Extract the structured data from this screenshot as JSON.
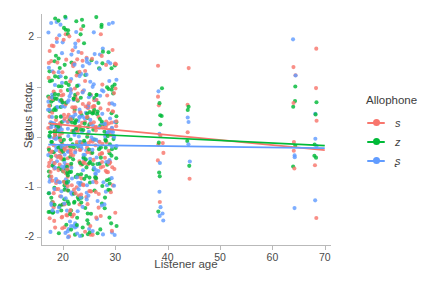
{
  "chart_data": {
    "type": "scatter",
    "title": "",
    "xlabel": "Listener age",
    "ylabel": "Status factor",
    "xlim": [
      16,
      71
    ],
    "ylim": [
      -2.15,
      2.45
    ],
    "xticks": [
      20,
      30,
      40,
      50,
      60,
      70
    ],
    "yticks": [
      -2,
      -1,
      0,
      1,
      2
    ],
    "grid": false,
    "legend_position": "right",
    "legend_title": "Allophone",
    "series": [
      {
        "name": "s",
        "color": "#F8766D",
        "trend_line": {
          "x0": 17.2,
          "y0": 0.27,
          "x1": 70.0,
          "y1": -0.26
        }
      },
      {
        "name": "z",
        "color": "#00BA38",
        "trend_line": {
          "x0": 17.2,
          "y0": 0.1,
          "x1": 70.0,
          "y1": -0.17
        }
      },
      {
        "name": "ʂ",
        "color": "#619CFF",
        "trend_line": {
          "x0": 17.2,
          "y0": -0.15,
          "x1": 70.0,
          "y1": -0.22
        }
      }
    ],
    "point_columns": [
      {
        "x": 17.4,
        "n": 40
      },
      {
        "x": 18.0,
        "n": 46
      },
      {
        "x": 18.6,
        "n": 44
      },
      {
        "x": 19.2,
        "n": 48
      },
      {
        "x": 19.8,
        "n": 46
      },
      {
        "x": 20.4,
        "n": 44
      },
      {
        "x": 21.0,
        "n": 42
      },
      {
        "x": 21.6,
        "n": 40
      },
      {
        "x": 22.2,
        "n": 42
      },
      {
        "x": 22.8,
        "n": 38
      },
      {
        "x": 23.4,
        "n": 40
      },
      {
        "x": 24.0,
        "n": 36
      },
      {
        "x": 24.6,
        "n": 34
      },
      {
        "x": 25.2,
        "n": 32
      },
      {
        "x": 25.8,
        "n": 30
      },
      {
        "x": 26.4,
        "n": 28
      },
      {
        "x": 27.0,
        "n": 26
      },
      {
        "x": 27.6,
        "n": 24
      },
      {
        "x": 28.2,
        "n": 26
      },
      {
        "x": 28.8,
        "n": 30
      },
      {
        "x": 29.4,
        "n": 28
      },
      {
        "x": 30.0,
        "n": 22
      },
      {
        "x": 38.4,
        "n": 20
      },
      {
        "x": 39.0,
        "n": 6
      },
      {
        "x": 44.0,
        "n": 12
      },
      {
        "x": 64.2,
        "n": 16
      },
      {
        "x": 68.2,
        "n": 14
      }
    ],
    "note": "Dense jittered point cloud concentrated between ages 17-30, sparse isolated clusters near ages 38-39, 44, 64 and 68; status factor values span roughly -2 to 2.4"
  },
  "axis": {
    "y_ticks": [
      "2",
      "1",
      "0",
      "-1",
      "-2"
    ],
    "x_ticks": [
      "20",
      "30",
      "40",
      "50",
      "60",
      "70"
    ],
    "y_title": "Status factor",
    "x_title": "Listener age"
  },
  "legend": {
    "title": "Allophone",
    "items": [
      {
        "label": "s",
        "color": "#F8766D"
      },
      {
        "label": "z",
        "color": "#00BA38"
      },
      {
        "label": "ʂ",
        "color": "#619CFF"
      }
    ]
  }
}
